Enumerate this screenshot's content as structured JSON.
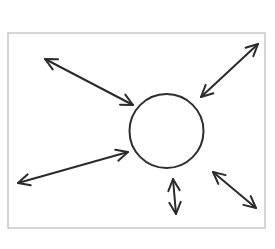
{
  "figure": {
    "canvas": {
      "width": 275,
      "height": 249
    },
    "colors": {
      "background": "#ffffff",
      "frame_stroke": "#b9b9b9",
      "ink": "#2b2b2b",
      "circle_stroke": "#2e2e2e"
    },
    "frame": {
      "name": "outer-border-rectangle",
      "x": 8,
      "y": 33,
      "width": 257,
      "height": 195,
      "stroke_width": 1.2
    },
    "circle": {
      "name": "center-circle",
      "cx": 166.5,
      "cy": 131,
      "r": 37,
      "stroke_width": 2.0
    },
    "arrows": [
      {
        "name": "arrow-upper-left",
        "direction": "upper-left",
        "double_headed": true,
        "tail": {
          "x": 133,
          "y": 105
        },
        "head": {
          "x": 45,
          "y": 59
        },
        "stroke_width": 2.0
      },
      {
        "name": "arrow-upper-right",
        "direction": "upper-right",
        "double_headed": true,
        "tail": {
          "x": 201,
          "y": 97
        },
        "head": {
          "x": 258,
          "y": 44
        },
        "stroke_width": 2.0
      },
      {
        "name": "arrow-left",
        "direction": "left",
        "double_headed": true,
        "tail": {
          "x": 128,
          "y": 152
        },
        "head": {
          "x": 18,
          "y": 183
        },
        "stroke_width": 2.0
      },
      {
        "name": "arrow-down",
        "direction": "down",
        "double_headed": true,
        "tail": {
          "x": 173,
          "y": 179
        },
        "head": {
          "x": 176,
          "y": 214
        },
        "stroke_width": 2.0
      },
      {
        "name": "arrow-lower-right",
        "direction": "lower-right",
        "double_headed": true,
        "tail": {
          "x": 213,
          "y": 172
        },
        "head": {
          "x": 256,
          "y": 208
        },
        "stroke_width": 2.0
      }
    ],
    "arrowhead": {
      "style": "open-v",
      "length": 13,
      "half_angle_deg": 26
    }
  }
}
